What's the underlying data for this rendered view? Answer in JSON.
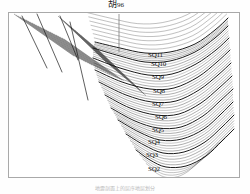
{
  "figure": {
    "type": "geological-seismic-cross-section",
    "background_color": "#ffffff",
    "frame_color": "#a9a9a9",
    "line_color": "#1a1a1a",
    "caption": "地震剖面上的层序地层划分"
  },
  "well": {
    "name_char": "胡",
    "name_number": "96",
    "full_label": "胡96",
    "track_top_y": 14,
    "track_bottom_y": 52
  },
  "sequence_labels": [
    {
      "id": "SQ11",
      "text": "SQ11",
      "x": 148,
      "y": 52
    },
    {
      "id": "SQ10",
      "text": "SQ10",
      "x": 151,
      "y": 61
    },
    {
      "id": "SQ9",
      "text": "SQ9",
      "x": 152,
      "y": 74
    },
    {
      "id": "SQ8",
      "text": "SQ8",
      "x": 153,
      "y": 88
    },
    {
      "id": "SQ7",
      "text": "SQ7",
      "x": 152,
      "y": 101
    },
    {
      "id": "SQ6",
      "text": "SQ6",
      "x": 155,
      "y": 114
    },
    {
      "id": "SQ5",
      "text": "SQ5",
      "x": 152,
      "y": 127
    },
    {
      "id": "SQ4",
      "text": "SQ4",
      "x": 148,
      "y": 139
    },
    {
      "id": "SQ3",
      "text": "SQ3",
      "x": 146,
      "y": 152
    },
    {
      "id": "SQ2",
      "text": "SQ2",
      "x": 148,
      "y": 166
    }
  ],
  "chart_data": {
    "type": "line",
    "xlabel": "",
    "ylabel": "",
    "legend": [
      "SQ11",
      "SQ10",
      "SQ9",
      "SQ8",
      "SQ7",
      "SQ6",
      "SQ5",
      "SQ4",
      "SQ3",
      "SQ2"
    ],
    "horizons": [
      {
        "name": "SQ11",
        "points": [
          [
            95,
            42
          ],
          [
            120,
            48
          ],
          [
            145,
            53
          ],
          [
            170,
            52
          ],
          [
            195,
            44
          ],
          [
            215,
            30
          ],
          [
            228,
            18
          ]
        ]
      },
      {
        "name": "SQ10",
        "points": [
          [
            93,
            48
          ],
          [
            120,
            56
          ],
          [
            145,
            62
          ],
          [
            170,
            61
          ],
          [
            195,
            52
          ],
          [
            215,
            38
          ],
          [
            228,
            26
          ]
        ]
      },
      {
        "name": "SQ9",
        "points": [
          [
            93,
            58
          ],
          [
            120,
            68
          ],
          [
            148,
            75
          ],
          [
            172,
            74
          ],
          [
            196,
            64
          ],
          [
            216,
            50
          ],
          [
            229,
            38
          ]
        ]
      },
      {
        "name": "SQ8",
        "points": [
          [
            95,
            70
          ],
          [
            122,
            82
          ],
          [
            150,
            89
          ],
          [
            174,
            88
          ],
          [
            198,
            77
          ],
          [
            217,
            62
          ],
          [
            230,
            50
          ]
        ]
      },
      {
        "name": "SQ7",
        "points": [
          [
            99,
            82
          ],
          [
            126,
            95
          ],
          [
            152,
            102
          ],
          [
            176,
            101
          ],
          [
            199,
            90
          ],
          [
            218,
            75
          ],
          [
            231,
            63
          ]
        ]
      },
      {
        "name": "SQ6",
        "points": [
          [
            105,
            95
          ],
          [
            130,
            108
          ],
          [
            156,
            115
          ],
          [
            179,
            114
          ],
          [
            201,
            103
          ],
          [
            219,
            88
          ],
          [
            232,
            76
          ]
        ]
      },
      {
        "name": "SQ5",
        "points": [
          [
            111,
            108
          ],
          [
            135,
            121
          ],
          [
            158,
            128
          ],
          [
            181,
            127
          ],
          [
            203,
            116
          ],
          [
            220,
            101
          ],
          [
            233,
            89
          ]
        ]
      },
      {
        "name": "SQ4",
        "points": [
          [
            118,
            120
          ],
          [
            139,
            132
          ],
          [
            160,
            140
          ],
          [
            182,
            139
          ],
          [
            204,
            129
          ],
          [
            221,
            114
          ],
          [
            233,
            102
          ]
        ]
      },
      {
        "name": "SQ3",
        "points": [
          [
            126,
            134
          ],
          [
            144,
            145
          ],
          [
            163,
            153
          ],
          [
            184,
            152
          ],
          [
            205,
            142
          ],
          [
            222,
            127
          ],
          [
            234,
            115
          ]
        ]
      },
      {
        "name": "SQ2",
        "points": [
          [
            136,
            150
          ],
          [
            150,
            160
          ],
          [
            166,
            167
          ],
          [
            186,
            166
          ],
          [
            206,
            156
          ],
          [
            222,
            141
          ],
          [
            234,
            129
          ]
        ]
      }
    ],
    "faults": [
      {
        "name": "fault-1",
        "x1": 22,
        "y1": 16,
        "x2": 47,
        "y2": 68
      },
      {
        "name": "fault-2",
        "x1": 37,
        "y1": 14,
        "x2": 62,
        "y2": 72
      },
      {
        "name": "fault-3",
        "x1": 70,
        "y1": 22,
        "x2": 88,
        "y2": 100
      },
      {
        "name": "fault-4",
        "x1": 60,
        "y1": 16,
        "x2": 78,
        "y2": 60
      }
    ],
    "syncline_axis_x": 166
  }
}
